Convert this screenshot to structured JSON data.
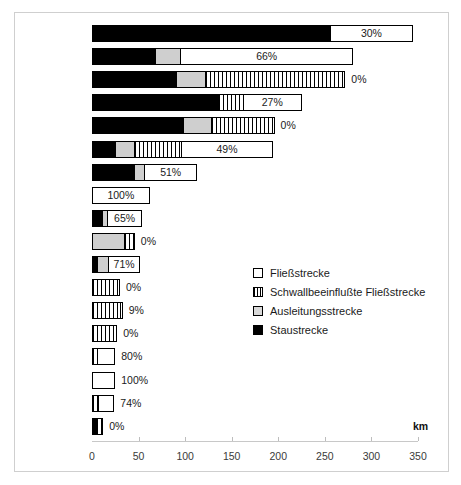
{
  "chart_data": {
    "type": "bar",
    "orientation": "horizontal",
    "stacked": true,
    "title": "",
    "xlabel": "km",
    "ylabel": "",
    "xlim": [
      0,
      350
    ],
    "xticks": [
      0,
      50,
      100,
      150,
      200,
      250,
      300,
      350
    ],
    "grid": false,
    "legend_position": "right-middle",
    "series": [
      {
        "name": "Staustrecke",
        "key": "stau",
        "color": "#000000",
        "values": [
          255,
          68,
          90,
          135,
          98,
          25,
          45,
          0,
          11,
          0,
          5,
          0,
          0,
          0,
          0,
          0,
          0,
          4
        ]
      },
      {
        "name": "Ausleitungsstrecke",
        "key": "ausl",
        "color": "#cfcfcf",
        "values": [
          0,
          27,
          31,
          0,
          30,
          20,
          11,
          0,
          5,
          34,
          12,
          0,
          0,
          0,
          0,
          0,
          0,
          0
        ]
      },
      {
        "name": "Schwallbeeinflußte Fließstrecke",
        "key": "schwall",
        "color": "#ffffff",
        "values": [
          0,
          0,
          151,
          27,
          68,
          51,
          0,
          0,
          0,
          12,
          0,
          30,
          30,
          27,
          5,
          0,
          6,
          8
        ]
      },
      {
        "name": "Fließstrecke",
        "key": "fliess",
        "color": "#ffffff",
        "values": [
          90,
          185,
          0,
          63,
          0,
          98,
          57,
          62,
          38,
          0,
          35,
          0,
          3,
          0,
          20,
          25,
          18,
          0
        ]
      }
    ],
    "categories": [
      "Donau",
      "Mur",
      "Inn",
      "Drau",
      "Enns",
      "Salzach",
      "Traun",
      "March",
      "Steyr",
      "Ill",
      "Lech",
      "Rhein",
      "Bregenzerach",
      "Ziller",
      "Ybbs",
      "Isel",
      "Gail",
      "Saalach"
    ],
    "annotations": [
      {
        "category": "Donau",
        "label": "30%"
      },
      {
        "category": "Mur",
        "label": "66%"
      },
      {
        "category": "Inn",
        "label": "0%"
      },
      {
        "category": "Drau",
        "label": "27%"
      },
      {
        "category": "Enns",
        "label": "0%"
      },
      {
        "category": "Salzach",
        "label": "49%"
      },
      {
        "category": "Traun",
        "label": "51%"
      },
      {
        "category": "March",
        "label": "100%"
      },
      {
        "category": "Steyr",
        "label": "65%"
      },
      {
        "category": "Ill",
        "label": "0%"
      },
      {
        "category": "Lech",
        "label": "71%"
      },
      {
        "category": "Rhein",
        "label": "0%"
      },
      {
        "category": "Bregenzerach",
        "label": "9%"
      },
      {
        "category": "Ziller",
        "label": "0%"
      },
      {
        "category": "Ybbs",
        "label": "80%"
      },
      {
        "category": "Isel",
        "label": "100%"
      },
      {
        "category": "Gail",
        "label": "74%"
      },
      {
        "category": "Saalach",
        "label": "0%"
      }
    ]
  },
  "axis": {
    "km_label": "km",
    "ticks": [
      "0",
      "50",
      "100",
      "150",
      "200",
      "250",
      "300",
      "350"
    ]
  },
  "legend": {
    "items": [
      {
        "label": "Fließstrecke",
        "swatch": "fliess"
      },
      {
        "label": "Schwallbeeinflußte Fließstrecke",
        "swatch": "schwall"
      },
      {
        "label": "Ausleitungsstrecke",
        "swatch": "ausl"
      },
      {
        "label": "Staustrecke",
        "swatch": "stau"
      }
    ]
  }
}
